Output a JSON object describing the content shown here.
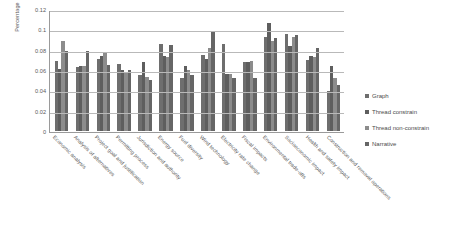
{
  "chart_data": {
    "type": "bar",
    "title": "",
    "xlabel": "",
    "ylabel": "Percentage",
    "ylim": [
      0,
      0.12
    ],
    "ytick_labels": [
      "0.12",
      "0.1",
      "0.08",
      "0.06",
      "0.04",
      "0.02",
      "0"
    ],
    "ytick_values": [
      0.12,
      0.1,
      0.08,
      0.06,
      0.04,
      0.02,
      0
    ],
    "grid": true,
    "legend_position": "right",
    "categories": [
      "Economic analysis",
      "Analysis of alternatives",
      "Project goal and justification",
      "Permitting process",
      "Jurisdiction and authority",
      "Energy source",
      "Fuel diversity",
      "Wind technology",
      "Electricity rate change",
      "Fiscal impacts",
      "Environmental trade-offs",
      "Socioeconomic impact",
      "Health and safety impact",
      "Construction and removal operations"
    ],
    "series": [
      {
        "name": "Graph",
        "color": "#6e6e6e",
        "values": [
          0.069,
          0.063,
          0.071,
          0.066,
          0.055,
          0.086,
          0.052,
          0.075,
          0.086,
          0.068,
          0.092,
          0.095,
          0.07,
          0.039
        ]
      },
      {
        "name": "Thread constrain",
        "color": "#5e5e5e",
        "values": [
          0.061,
          0.064,
          0.074,
          0.06,
          0.068,
          0.074,
          0.064,
          0.071,
          0.056,
          0.068,
          0.106,
          0.084,
          0.074,
          0.064
        ]
      },
      {
        "name": "Thread non-constrain",
        "color": "#8c8c8c",
        "values": [
          0.089,
          0.064,
          0.077,
          0.057,
          0.053,
          0.073,
          0.06,
          0.082,
          0.056,
          0.069,
          0.089,
          0.092,
          0.073,
          0.052
        ]
      },
      {
        "name": "Narrative",
        "color": "#666666",
        "values": [
          0.079,
          0.079,
          0.065,
          0.06,
          0.05,
          0.085,
          0.055,
          0.097,
          0.052,
          0.052,
          0.091,
          0.094,
          0.082,
          0.045
        ]
      }
    ]
  },
  "legend": {
    "items": [
      {
        "label": "Graph"
      },
      {
        "label": "Thread constrain"
      },
      {
        "label": "Thread non-constrain"
      },
      {
        "label": "Narrative"
      }
    ]
  }
}
